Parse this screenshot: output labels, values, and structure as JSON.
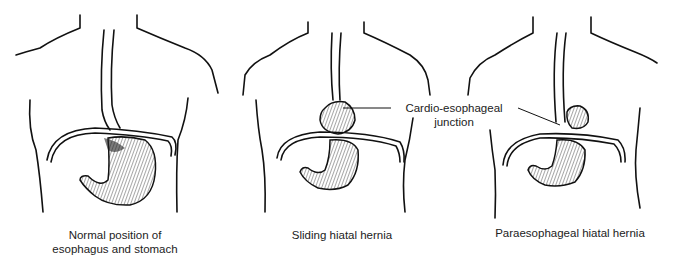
{
  "panels": [
    {
      "id": "normal",
      "caption_line1": "Normal position of",
      "caption_line2": "esophagus and stomach"
    },
    {
      "id": "sliding",
      "caption_line1": "Sliding hiatal hernia",
      "caption_line2": ""
    },
    {
      "id": "paraesophageal",
      "caption_line1": "Paraesophageal hiatal hernia",
      "caption_line2": ""
    }
  ],
  "annotation": {
    "line1": "Cardio-esophageal",
    "line2": "junction"
  }
}
